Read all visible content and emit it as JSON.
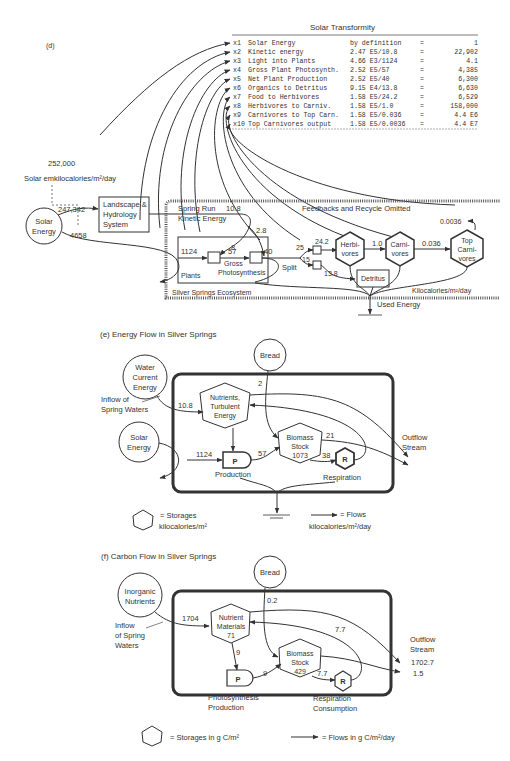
{
  "panel_d": {
    "label": "(d)",
    "table": {
      "title": "Solar Transformity",
      "rows": [
        {
          "id": "x1",
          "name": "Solar Energy",
          "calc": "by definition",
          "eq": "=",
          "value": "1"
        },
        {
          "id": "x2",
          "name": "Kinetic energy",
          "calc": "2.47 E5/10.8",
          "eq": "=",
          "value": "22,902"
        },
        {
          "id": "x3",
          "name": "Light into Plants",
          "calc": "4.66 E3/1124",
          "eq": "=",
          "value": "4.1"
        },
        {
          "id": "x4",
          "name": "Gross Plant Photosynth.",
          "calc": "2.52 E5/57",
          "eq": "=",
          "value": "4,385"
        },
        {
          "id": "x5",
          "name": "Net Plant Production",
          "calc": "2.52 E5/40",
          "eq": "=",
          "value": "6,300"
        },
        {
          "id": "x6",
          "name": "Organics to Detritus",
          "calc": "9.15 E4/13.8",
          "eq": "=",
          "value": "6,630"
        },
        {
          "id": "x7",
          "name": "Food to Herbivores",
          "calc": "1.58 E5/24.2",
          "eq": "=",
          "value": "6,529"
        },
        {
          "id": "x8",
          "name": "Herbivores to Carniv.",
          "calc": "1.58 E5/1.0",
          "eq": "=",
          "value": "158,000"
        },
        {
          "id": "x9",
          "name": "Carnivores to Top Carn.",
          "calc": "1.58 E5/0.036",
          "eq": "=",
          "value": "4.4 E6"
        },
        {
          "id": "x10",
          "name": "Top Carnivores output",
          "calc": "1.58 E5/0.0036",
          "eq": "=",
          "value": "4.4 E7"
        }
      ]
    },
    "solar_emkcal_value": "252,000",
    "solar_emkcal_label": "Solar emkilocalories/m²/day",
    "solar_source": [
      "Solar",
      "Energy"
    ],
    "flow_to_landscape": "247,342",
    "flow_to_ecosystem": "4658",
    "landscape_box": [
      "Landscape &",
      "Hydrology",
      "System"
    ],
    "spring_run": [
      "Spring Run",
      "Kinetic Energy"
    ],
    "kinetic_value": "10.8",
    "feedback_note": "Feedbacks and Recycle Omitted",
    "flows": {
      "light": "1124",
      "k1": "8",
      "k2": "2.8",
      "gross": "57",
      "net": "40",
      "split_up": "25",
      "split_down": "15",
      "to_herb": "24.2",
      "to_detritus": "13.8",
      "herb_carn": "1.0",
      "carn_top": "0.036",
      "top_out": "0.0036"
    },
    "nodes": {
      "plants": "Plants",
      "gross": [
        "Gross",
        "Photosynthesis"
      ],
      "split": "Split",
      "herbivores": [
        "Herbi-",
        "vores"
      ],
      "carnivores": [
        "Carni-",
        "vores"
      ],
      "top": [
        "Top",
        "Carni-",
        "vores"
      ],
      "detritus": "Detritus"
    },
    "ecosystem_label": "Silver Springs Ecosystem",
    "units": "Kilocalories/m²/day",
    "used_energy": "Used Energy"
  },
  "panel_e": {
    "title": "(e) Energy Flow in Silver Springs",
    "water_source": [
      "Water",
      "Current",
      "Energy"
    ],
    "inflow_label": [
      "Inflow of",
      "Spring Waters"
    ],
    "solar_source": [
      "Solar",
      "Energy"
    ],
    "bread": "Bread",
    "nutrients": [
      "Nutrients,",
      "Turbulent",
      "Energy"
    ],
    "biomass": [
      "Biomass",
      "Stock",
      "1073"
    ],
    "production_symbol": "P",
    "production_label": "Production",
    "respiration_symbol": "R",
    "respiration_label": "Respiration",
    "outflow": [
      "Outflow",
      "Stream"
    ],
    "flows": {
      "water": "10.8",
      "bread": "2",
      "light": "1124",
      "gpp": "57",
      "out": "21",
      "resp": "38"
    },
    "legend_storage": [
      "= Storages",
      "kilocalories/m²"
    ],
    "legend_flow": [
      "= Flows",
      "kilocalories/m²/day"
    ]
  },
  "panel_f": {
    "title": "(f) Carbon Flow in Silver Springs",
    "source": [
      "Inorganic",
      "Nutrients"
    ],
    "inflow_label": [
      "Inflow",
      "of Spring",
      "Waters"
    ],
    "bread": "Bread",
    "nutrients": [
      "Nutrient",
      "Materials",
      "71"
    ],
    "biomass": [
      "Biomass",
      "Stock",
      "429"
    ],
    "production_symbol": "P",
    "production_label": [
      "Photosynthesis",
      "Production"
    ],
    "respiration_symbol": "R",
    "respiration_label": [
      "Respiration",
      "Consumption"
    ],
    "outflow": [
      "Outflow",
      "Stream"
    ],
    "flows": {
      "inflow": "1704",
      "bread": "0.2",
      "uptake": "9",
      "gpp": "9",
      "resp": "7.7",
      "recycle": "7.7",
      "out1": "1702.7",
      "out2": "1.5"
    },
    "legend_storage": "= Storages in g C/m²",
    "legend_flow": "= Flows in g C/m²/day"
  }
}
